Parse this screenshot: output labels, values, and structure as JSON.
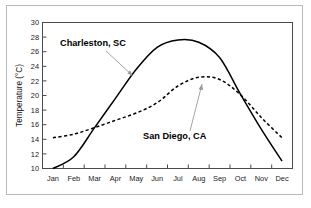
{
  "figure": {
    "name": "monthly-mean-temperature-comparison"
  },
  "chart_data": {
    "type": "line",
    "title": "",
    "xlabel": "",
    "ylabel": "Temperature (°C)",
    "categories": [
      "Jan",
      "Feb",
      "Mar",
      "Apr",
      "May",
      "Jun",
      "Jul",
      "Aug",
      "Sep",
      "Oct",
      "Nov",
      "Dec"
    ],
    "ylim": [
      10,
      30
    ],
    "yticks": [
      10,
      12,
      14,
      16,
      18,
      20,
      22,
      24,
      26,
      28,
      30
    ],
    "ytick_labels": [
      "10",
      "12",
      "14",
      "16",
      "18",
      "20",
      "22",
      "24",
      "26",
      "28",
      "30"
    ],
    "grid": false,
    "legend": "inline-annotations",
    "series": [
      {
        "name": "Charleston, SC",
        "style": "solid",
        "color": "#000000",
        "values": [
          10.0,
          11.6,
          15.6,
          19.6,
          23.6,
          26.6,
          27.6,
          27.3,
          25.2,
          20.2,
          15.4,
          11.0
        ]
      },
      {
        "name": "San Diego, CA",
        "style": "dashed",
        "color": "#000000",
        "values": [
          14.2,
          14.7,
          15.6,
          16.6,
          17.6,
          19.0,
          21.3,
          22.5,
          22.2,
          20.1,
          17.0,
          14.2
        ]
      }
    ],
    "annotations": [
      {
        "text": "Charleston, SC",
        "target_series": "Charleston, SC",
        "arrow": "down-right"
      },
      {
        "text": "San Diego, CA",
        "target_series": "San Diego, CA",
        "arrow": "up-right"
      }
    ]
  }
}
